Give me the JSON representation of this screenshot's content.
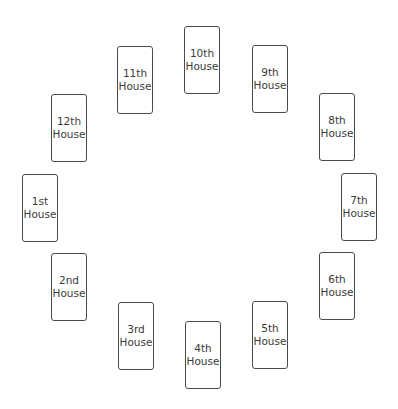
{
  "diagram": {
    "cards": [
      {
        "number": "1st",
        "label": "House",
        "x": 22,
        "y": 174
      },
      {
        "number": "2nd",
        "label": "House",
        "x": 51,
        "y": 253
      },
      {
        "number": "3rd",
        "label": "House",
        "x": 118,
        "y": 302
      },
      {
        "number": "4th",
        "label": "House",
        "x": 185,
        "y": 321
      },
      {
        "number": "5th",
        "label": "House",
        "x": 252,
        "y": 301
      },
      {
        "number": "6th",
        "label": "House",
        "x": 319,
        "y": 252
      },
      {
        "number": "7th",
        "label": "House",
        "x": 341,
        "y": 173
      },
      {
        "number": "8th",
        "label": "House",
        "x": 319,
        "y": 93
      },
      {
        "number": "9th",
        "label": "House",
        "x": 252,
        "y": 45
      },
      {
        "number": "10th",
        "label": "House",
        "x": 184,
        "y": 26
      },
      {
        "number": "11th",
        "label": "House",
        "x": 117,
        "y": 46
      },
      {
        "number": "12th",
        "label": "House",
        "x": 51,
        "y": 94
      }
    ],
    "colors": {
      "border": "#4a4a4a",
      "text": "#3a3a3a",
      "background": "#ffffff"
    }
  }
}
